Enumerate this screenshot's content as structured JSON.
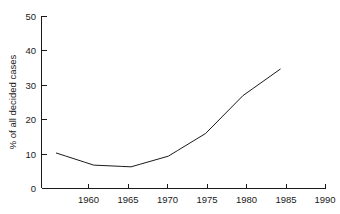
{
  "chart_data": {
    "type": "line",
    "title": "",
    "subtitle": "",
    "xlabel": "",
    "ylabel": "% of all decided cases",
    "x": [
      1960,
      1965,
      1970,
      1975,
      1980,
      1985,
      1990
    ],
    "values": [
      10.3,
      6.8,
      6.3,
      9.4,
      16.0,
      27.0,
      34.7
    ],
    "series": [
      {
        "name": "% of all decided cases",
        "values": [
          10.3,
          6.8,
          6.3,
          9.4,
          16.0,
          27.0,
          34.7
        ]
      }
    ],
    "xlim": [
      1958,
      1996
    ],
    "ylim": [
      0,
      50
    ],
    "xticks": [
      1960,
      1965,
      1970,
      1975,
      1980,
      1985,
      1990,
      1995
    ],
    "xtick_labels": [
      "1960",
      "1965",
      "1970",
      "1975",
      "1980",
      "1985",
      "1990",
      ""
    ],
    "yticks": [
      0,
      10,
      20,
      30,
      40,
      50
    ],
    "ytick_labels": [
      "0",
      "10",
      "20",
      "30",
      "40",
      "50"
    ],
    "grid": false,
    "legend": false,
    "legend_position": "none",
    "line_color": "#1a1a1a",
    "background_color": "#ffffff",
    "annotations": []
  },
  "axes": {
    "y_ticks": [
      {
        "label": "50",
        "value": 50
      },
      {
        "label": "40",
        "value": 40
      },
      {
        "label": "30",
        "value": 30
      },
      {
        "label": "20",
        "value": 20
      },
      {
        "label": "10",
        "value": 10
      },
      {
        "label": "0",
        "value": 0
      }
    ],
    "x_ticks": [
      {
        "label": "1960",
        "value": 1960
      },
      {
        "label": "1965",
        "value": 1965
      },
      {
        "label": "1970",
        "value": 1970
      },
      {
        "label": "1975",
        "value": 1975
      },
      {
        "label": "1980",
        "value": 1980
      },
      {
        "label": "1985",
        "value": 1985
      },
      {
        "label": "1990",
        "value": 1990
      },
      {
        "label": "",
        "value": 1995
      }
    ],
    "y_axis_title": "% of all decided cases"
  }
}
